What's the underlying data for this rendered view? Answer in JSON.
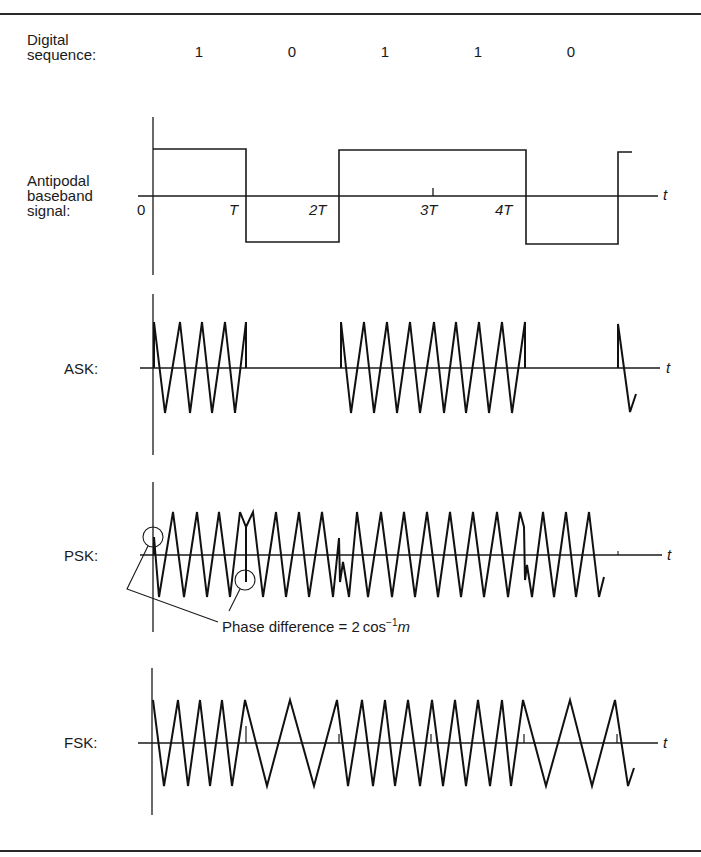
{
  "figure": {
    "rows": {
      "sequence": {
        "label_line1": "Digital",
        "label_line2": "sequence:"
      },
      "baseband": {
        "label_line1": "Antipodal",
        "label_line2": "baseband",
        "label_line3": "signal:"
      },
      "ask": {
        "label": "ASK:"
      },
      "psk": {
        "label": "PSK:"
      },
      "fsk": {
        "label": "FSK:"
      }
    },
    "bits": [
      "1",
      "0",
      "1",
      "1",
      "0"
    ],
    "time_ticks": [
      "0",
      "T",
      "2T",
      "3T",
      "4T"
    ],
    "axis_label": "t",
    "annotation": {
      "text_main": "Phase difference = 2 cos",
      "text_sup": "−1",
      "text_var": "m"
    },
    "colors": {
      "ink": "#1a1a1a",
      "rule": "#2a2a2a",
      "background": "#ffffff"
    }
  }
}
